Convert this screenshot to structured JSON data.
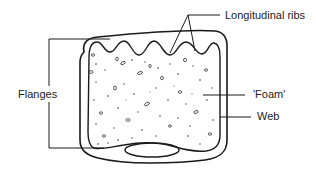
{
  "diagram": {
    "title": "",
    "labels": {
      "ribs": "Longitudinal ribs",
      "flanges": "Flanges",
      "foam": "'Foam'",
      "web": "Web"
    },
    "colors": {
      "line": "#1a1a1a",
      "background": "#ffffff",
      "text": "#222222"
    },
    "components": [
      {
        "id": "outer-web",
        "label": "Web",
        "shape": "rounded-box outer wall"
      },
      {
        "id": "foam-core",
        "label": "'Foam'",
        "shape": "stippled interior with wavy top"
      },
      {
        "id": "ribs",
        "label": "Longitudinal ribs",
        "shape": "wavy top edge bumps",
        "count_visible": 5
      },
      {
        "id": "flanges",
        "label": "Flanges",
        "shape": "bracket spanning top and bottom"
      },
      {
        "id": "bottom-channel",
        "label": "",
        "shape": "ellipse at bottom"
      }
    ]
  }
}
